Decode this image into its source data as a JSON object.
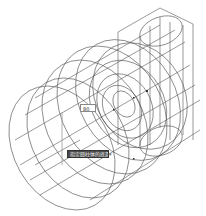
{
  "app": {
    "type": "CAD 3D wireframe viewport"
  },
  "viewport": {
    "model": "isometric wireframe of pump housing with stacked cylinders and vertical cylinder",
    "line_color": "#444444",
    "background": "#ffffff"
  },
  "dynamic_input": {
    "value": "80"
  },
  "tooltip": {
    "text": "指定圆柱体的底面半径",
    "arrow": "▾"
  },
  "crosshair": {
    "x": 62,
    "y": 140
  }
}
